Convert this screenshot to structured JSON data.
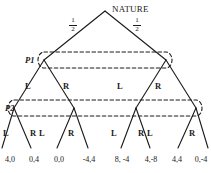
{
  "figure": {
    "type": "extensive-form-game-tree",
    "nature_label": "NATURE",
    "player1_label": "P1",
    "player2_label": "P2",
    "chance_probabilities": [
      {
        "numerator": "1",
        "denominator": "2"
      },
      {
        "numerator": "1",
        "denominator": "2"
      }
    ],
    "tier2_actions": [
      "L",
      "R",
      "L",
      "R"
    ],
    "tier3_actions": [
      "L",
      "R",
      "L",
      "R",
      "L",
      "R",
      "L",
      "R"
    ],
    "payoffs": [
      "4,0",
      "0,4",
      "0,0",
      "-4,4",
      "8, -4",
      "4,-8",
      "4,4",
      "0,-4"
    ],
    "colors": {
      "line": "#1a1a1a",
      "dashed": "#1a1a1a",
      "text": "#1a1a1a",
      "background": "#ffffff"
    }
  }
}
